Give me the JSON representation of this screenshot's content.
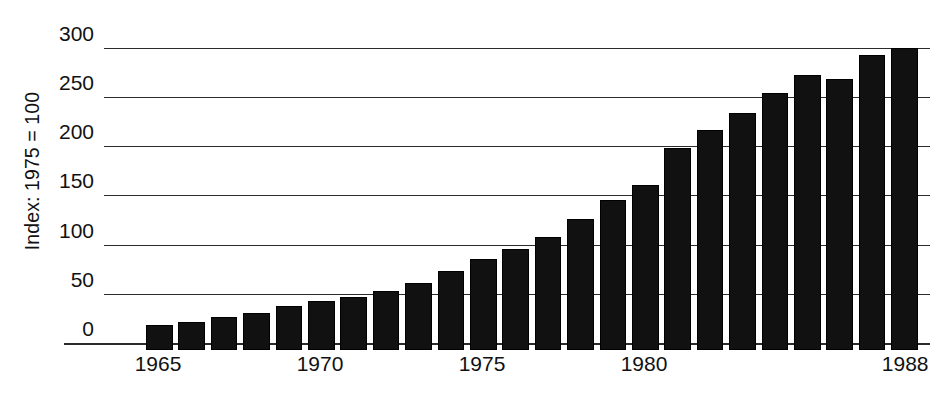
{
  "chart_data": {
    "type": "bar",
    "title": "",
    "subtitle": "",
    "xlabel": "",
    "ylabel": "Index: 1975 = 100",
    "ylim": [
      0,
      320
    ],
    "yticks": [
      0,
      50,
      100,
      150,
      200,
      250,
      300
    ],
    "ytick_labels": [
      "0",
      "50",
      "100",
      "150",
      "200",
      "250",
      "300"
    ],
    "grid": true,
    "legend": null,
    "legend_position": "none",
    "bar_color": "#111111",
    "axis_color": "#2b2b2b",
    "x_tick_labels": [
      "1965",
      "1970",
      "1975",
      "1980",
      "1988"
    ],
    "x_tick_years": [
      1965,
      1970,
      1975,
      1980,
      1988
    ],
    "categories": [
      "1965",
      "1966",
      "1967",
      "1968",
      "1969",
      "1970",
      "1971",
      "1972",
      "1973",
      "1974",
      "1975",
      "1976",
      "1977",
      "1978",
      "1979",
      "1980",
      "1981",
      "1982",
      "1983",
      "1984",
      "1985",
      "1986",
      "1987",
      "1988"
    ],
    "values": [
      25,
      28,
      34,
      38,
      45,
      50,
      54,
      60,
      68,
      80,
      92,
      103,
      115,
      133,
      152,
      168,
      205,
      224,
      241,
      261,
      279,
      275,
      300,
      307
    ]
  }
}
